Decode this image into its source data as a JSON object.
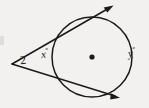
{
  "figure": {
    "type": "geometry-diagram",
    "background_color": "#f2f1ef",
    "ink_color": "#1a1a1a",
    "labels": {
      "vertex_angle": "2",
      "inner_arc_angle": "x",
      "outer_arc_angle": "y",
      "degree_symbol": "°"
    },
    "circle": {
      "center_x": 92,
      "center_y": 57,
      "radius": 40,
      "center_dot_radius": 2.6
    },
    "external_point": {
      "x": 12,
      "y": 64
    },
    "tangent_rays": [
      {
        "name": "upper-tangent-ray",
        "from_x": 12,
        "from_y": 64,
        "to_x": 112,
        "to_y": 6,
        "arrowhead": true
      },
      {
        "name": "lower-tangent-ray",
        "from_x": 12,
        "from_y": 64,
        "to_x": 118,
        "to_y": 98,
        "arrowhead": true
      }
    ]
  }
}
